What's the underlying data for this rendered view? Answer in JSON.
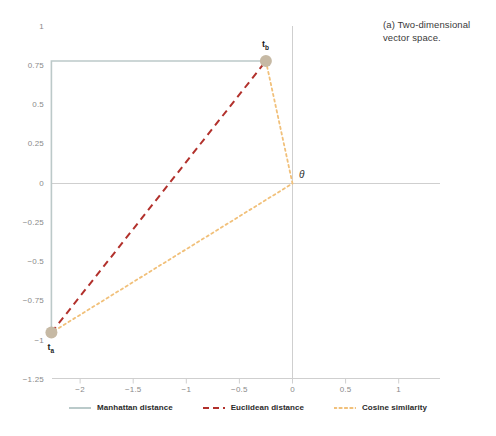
{
  "caption": "(a) Two-dimensional vector space.",
  "chart_data": {
    "type": "scatter",
    "title": "",
    "subtitle": "",
    "xlabel": "",
    "ylabel": "",
    "xlim": [
      -2.3,
      1.0
    ],
    "ylim": [
      -1.25,
      1.0
    ],
    "xticks": [
      "-2",
      "-1.5",
      "-1",
      "-0.5",
      "0",
      "0.5",
      "1"
    ],
    "xtick_values": [
      -2,
      -1.5,
      -1,
      -0.5,
      0,
      0.5,
      1
    ],
    "yticks": [
      "1",
      "0.75",
      "0.5",
      "0.25",
      "0",
      "-0.25",
      "-0.5",
      "-0.75",
      "-1",
      "-1.25"
    ],
    "ytick_values": [
      1,
      0.75,
      0.5,
      0.25,
      0,
      -0.25,
      -0.5,
      -0.75,
      -1,
      -1.25
    ],
    "grid": false,
    "legend_position": "bottom",
    "points": [
      {
        "name": "t_a",
        "label": "t",
        "sub": "a",
        "x": -2.27,
        "y": -0.95
      },
      {
        "name": "t_b",
        "label": "t",
        "sub": "b",
        "x": -0.25,
        "y": 0.78
      }
    ],
    "angle_label": "θ",
    "angle_vertex": {
      "x": 0,
      "y": 0
    },
    "series": [
      {
        "name": "Manhattan distance",
        "style": "solid",
        "color": "#bcc9c9",
        "path": [
          {
            "x": -0.25,
            "y": 0.78
          },
          {
            "x": -2.27,
            "y": 0.78
          },
          {
            "x": -2.27,
            "y": -0.95
          }
        ]
      },
      {
        "name": "Euclidean distance",
        "style": "dashed",
        "color": "#b2312c",
        "path": [
          {
            "x": -2.27,
            "y": -0.95
          },
          {
            "x": -0.25,
            "y": 0.78
          }
        ]
      },
      {
        "name": "Cosine similarity",
        "style": "dotted",
        "color": "#f1c07a",
        "path": [
          {
            "x": -0.25,
            "y": 0.78
          },
          {
            "x": 0,
            "y": 0
          },
          {
            "x": -2.27,
            "y": -0.95
          }
        ]
      }
    ],
    "legend": [
      {
        "label": "Manhattan distance",
        "color": "#9db4b4",
        "style": "solid"
      },
      {
        "label": "Euclidean distance",
        "color": "#b2312c",
        "style": "dashed"
      },
      {
        "label": "Cosine similarity",
        "color": "#f1c07a",
        "style": "dotted"
      }
    ],
    "axis_color": "#cfcfcf",
    "marker_color": "#c6b9a4"
  }
}
